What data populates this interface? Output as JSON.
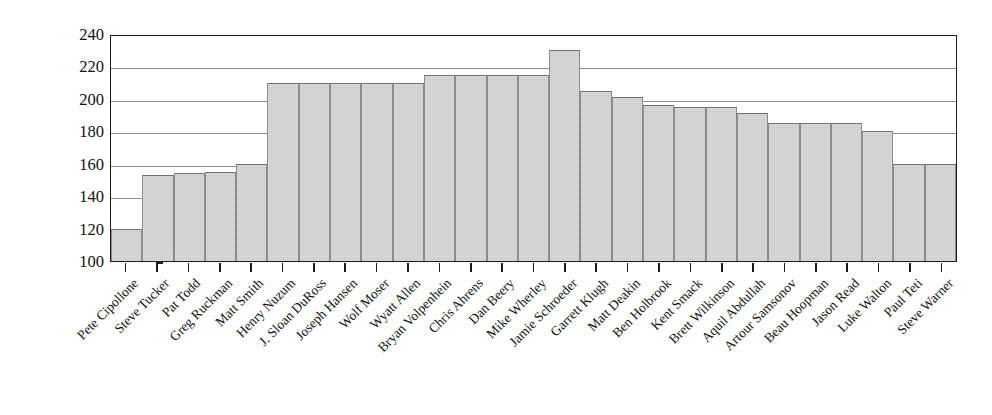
{
  "chart_data": {
    "type": "bar",
    "title": "",
    "xlabel": "",
    "ylabel": "Weight",
    "ylim": [
      100,
      240
    ],
    "ytick_step": 20,
    "yticks": [
      240,
      220,
      200,
      180,
      160,
      140,
      120,
      100
    ],
    "grid": true,
    "legend": "none",
    "bar_fill_color": "#c9c9c9",
    "bar_border_color": "#6f6f6f",
    "axis_color": "#1c1c1c",
    "gridline_color": "#8e8e8e",
    "categories": [
      "Pete Cipollone",
      "Steve Tucker",
      "Pat Todd",
      "Greg Ruckman",
      "Matt Smith",
      "Henry Nuzum",
      "J. Sloan DuRoss",
      "Joseph Hansen",
      "Wolf Moser",
      "Wyatt Allen",
      "Bryan Volpenhein",
      "Chris Ahrens",
      "Dan Beery",
      "Mike Wherley",
      "Jamie Schroeder",
      "Garrett Klugh",
      "Matt Deakin",
      "Ben Holbrook",
      "Kent Smack",
      "Brett Wilkinson",
      "Aquil Abdullah",
      "Artour Samsonov",
      "Beau Hoopman",
      "Jason Read",
      "Luke Walton",
      "Paul Teti",
      "Steve Warner"
    ],
    "values": [
      120,
      153,
      154,
      155,
      160,
      210,
      210,
      210,
      210,
      210,
      215,
      215,
      215,
      215,
      230,
      205,
      201,
      196,
      195,
      195,
      191,
      185,
      185,
      185,
      180,
      160,
      160
    ]
  }
}
